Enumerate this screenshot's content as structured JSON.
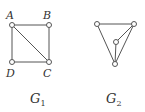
{
  "graphs": [
    {
      "name": "G",
      "subscript": "1",
      "nodes": [
        {
          "id": "A",
          "label": "A",
          "x": 12,
          "y": 25
        },
        {
          "id": "B",
          "label": "B",
          "x": 49,
          "y": 25
        },
        {
          "id": "D",
          "label": "D",
          "x": 12,
          "y": 62
        },
        {
          "id": "C",
          "label": "C",
          "x": 49,
          "y": 62
        }
      ],
      "edges": [
        [
          "A",
          "B"
        ],
        [
          "A",
          "D"
        ],
        [
          "B",
          "C"
        ],
        [
          "D",
          "C"
        ],
        [
          "A",
          "C"
        ]
      ]
    },
    {
      "name": "G",
      "subscript": "2",
      "nodes": [
        {
          "id": "p",
          "label": "",
          "x": 97,
          "y": 24
        },
        {
          "id": "q",
          "label": "",
          "x": 134,
          "y": 24
        },
        {
          "id": "r",
          "label": "",
          "x": 116,
          "y": 42
        },
        {
          "id": "s",
          "label": "",
          "x": 115,
          "y": 64
        }
      ],
      "edges": [
        [
          "p",
          "q"
        ],
        [
          "p",
          "s"
        ],
        [
          "q",
          "s"
        ],
        [
          "q",
          "r"
        ],
        [
          "r",
          "s"
        ]
      ]
    }
  ]
}
